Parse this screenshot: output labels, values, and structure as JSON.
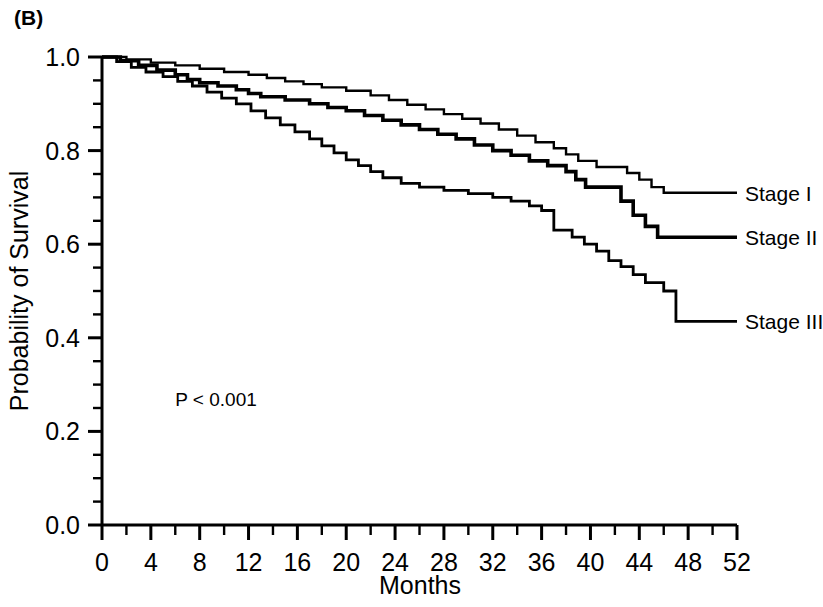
{
  "figure": {
    "panel_label": "(B)",
    "annotation": "P < 0.001"
  },
  "chart_data": {
    "type": "line",
    "title": "",
    "subtitle": "",
    "xlabel": "Months",
    "ylabel": "Probability of Survival",
    "xlim": [
      0,
      52
    ],
    "ylim": [
      0.0,
      1.0
    ],
    "xticks": [
      0,
      4,
      8,
      12,
      16,
      20,
      24,
      28,
      32,
      36,
      40,
      44,
      48,
      52
    ],
    "xtick_labels": [
      "0",
      "4",
      "8",
      "12",
      "16",
      "20",
      "24",
      "28",
      "32",
      "36",
      "40",
      "44",
      "48",
      "52"
    ],
    "x_minor_tick_step": 2,
    "yticks": [
      0.0,
      0.2,
      0.4,
      0.6,
      0.8,
      1.0
    ],
    "ytick_labels": [
      "0.0",
      "0.2",
      "0.4",
      "0.6",
      "0.8",
      "1.0"
    ],
    "y_minor_tick_step": 0.05,
    "grid": false,
    "legend_position": "right",
    "annotations": [
      {
        "text": "P < 0.001",
        "x": 6,
        "y": 0.255
      }
    ],
    "series": [
      {
        "name": "Stage I",
        "legend_label": "Stage I",
        "color": "#000000",
        "line_width": 2.4,
        "final_value": 0.71,
        "steps": [
          [
            0,
            1.0
          ],
          [
            2,
            1.0
          ],
          [
            2,
            0.995
          ],
          [
            4,
            0.995
          ],
          [
            4,
            0.988
          ],
          [
            6,
            0.988
          ],
          [
            6,
            0.982
          ],
          [
            8,
            0.982
          ],
          [
            8,
            0.975
          ],
          [
            10,
            0.975
          ],
          [
            10,
            0.968
          ],
          [
            12,
            0.968
          ],
          [
            12,
            0.962
          ],
          [
            13.5,
            0.962
          ],
          [
            13.5,
            0.955
          ],
          [
            15,
            0.955
          ],
          [
            15,
            0.948
          ],
          [
            16.5,
            0.948
          ],
          [
            16.5,
            0.942
          ],
          [
            18,
            0.942
          ],
          [
            18,
            0.935
          ],
          [
            20,
            0.935
          ],
          [
            20,
            0.928
          ],
          [
            22,
            0.928
          ],
          [
            22,
            0.918
          ],
          [
            23.5,
            0.918
          ],
          [
            23.5,
            0.908
          ],
          [
            25,
            0.908
          ],
          [
            25,
            0.898
          ],
          [
            26.5,
            0.898
          ],
          [
            26.5,
            0.888
          ],
          [
            28,
            0.888
          ],
          [
            28,
            0.878
          ],
          [
            29.5,
            0.878
          ],
          [
            29.5,
            0.868
          ],
          [
            31,
            0.868
          ],
          [
            31,
            0.858
          ],
          [
            32.5,
            0.858
          ],
          [
            32.5,
            0.845
          ],
          [
            34,
            0.845
          ],
          [
            34,
            0.832
          ],
          [
            35.5,
            0.832
          ],
          [
            35.5,
            0.818
          ],
          [
            37,
            0.818
          ],
          [
            37,
            0.805
          ],
          [
            38,
            0.805
          ],
          [
            38,
            0.792
          ],
          [
            39,
            0.792
          ],
          [
            39,
            0.778
          ],
          [
            40.5,
            0.778
          ],
          [
            40.5,
            0.765
          ],
          [
            43,
            0.765
          ],
          [
            43,
            0.752
          ],
          [
            44,
            0.752
          ],
          [
            44,
            0.738
          ],
          [
            45,
            0.738
          ],
          [
            45,
            0.722
          ],
          [
            46,
            0.722
          ],
          [
            46,
            0.71
          ],
          [
            52,
            0.71
          ]
        ]
      },
      {
        "name": "Stage II",
        "legend_label": "Stage II",
        "color": "#000000",
        "line_width": 3.6,
        "final_value": 0.615,
        "steps": [
          [
            0,
            1.0
          ],
          [
            1.5,
            1.0
          ],
          [
            1.5,
            0.992
          ],
          [
            3,
            0.992
          ],
          [
            3,
            0.982
          ],
          [
            4.5,
            0.982
          ],
          [
            4.5,
            0.972
          ],
          [
            6,
            0.972
          ],
          [
            6,
            0.962
          ],
          [
            7,
            0.962
          ],
          [
            7,
            0.952
          ],
          [
            8,
            0.952
          ],
          [
            8,
            0.945
          ],
          [
            9.5,
            0.945
          ],
          [
            9.5,
            0.938
          ],
          [
            11,
            0.938
          ],
          [
            11,
            0.93
          ],
          [
            12,
            0.93
          ],
          [
            12,
            0.922
          ],
          [
            13,
            0.922
          ],
          [
            13,
            0.915
          ],
          [
            15,
            0.915
          ],
          [
            15,
            0.908
          ],
          [
            17,
            0.908
          ],
          [
            17,
            0.9
          ],
          [
            18.5,
            0.9
          ],
          [
            18.5,
            0.892
          ],
          [
            20,
            0.892
          ],
          [
            20,
            0.885
          ],
          [
            21.5,
            0.885
          ],
          [
            21.5,
            0.875
          ],
          [
            23,
            0.875
          ],
          [
            23,
            0.865
          ],
          [
            24.5,
            0.865
          ],
          [
            24.5,
            0.855
          ],
          [
            26,
            0.855
          ],
          [
            26,
            0.845
          ],
          [
            27.5,
            0.845
          ],
          [
            27.5,
            0.835
          ],
          [
            29,
            0.835
          ],
          [
            29,
            0.825
          ],
          [
            30.5,
            0.825
          ],
          [
            30.5,
            0.812
          ],
          [
            32,
            0.812
          ],
          [
            32,
            0.8
          ],
          [
            33.5,
            0.8
          ],
          [
            33.5,
            0.79
          ],
          [
            35,
            0.79
          ],
          [
            35,
            0.778
          ],
          [
            36.5,
            0.778
          ],
          [
            36.5,
            0.768
          ],
          [
            38,
            0.768
          ],
          [
            38,
            0.755
          ],
          [
            38.8,
            0.755
          ],
          [
            38.8,
            0.738
          ],
          [
            39.6,
            0.738
          ],
          [
            39.6,
            0.722
          ],
          [
            42.5,
            0.722
          ],
          [
            42.5,
            0.692
          ],
          [
            43.5,
            0.692
          ],
          [
            43.5,
            0.662
          ],
          [
            44.5,
            0.662
          ],
          [
            44.5,
            0.638
          ],
          [
            45.5,
            0.638
          ],
          [
            45.5,
            0.615
          ],
          [
            52,
            0.615
          ]
        ]
      },
      {
        "name": "Stage III",
        "legend_label": "Stage III",
        "color": "#000000",
        "line_width": 2.8,
        "final_value": 0.435,
        "steps": [
          [
            0,
            1.0
          ],
          [
            1.2,
            1.0
          ],
          [
            1.2,
            0.99
          ],
          [
            2.4,
            0.99
          ],
          [
            2.4,
            0.978
          ],
          [
            3.6,
            0.978
          ],
          [
            3.6,
            0.968
          ],
          [
            5,
            0.968
          ],
          [
            5,
            0.958
          ],
          [
            6.2,
            0.958
          ],
          [
            6.2,
            0.948
          ],
          [
            7.4,
            0.948
          ],
          [
            7.4,
            0.938
          ],
          [
            8.6,
            0.938
          ],
          [
            8.6,
            0.925
          ],
          [
            9.8,
            0.925
          ],
          [
            9.8,
            0.912
          ],
          [
            11,
            0.912
          ],
          [
            11,
            0.9
          ],
          [
            12.2,
            0.9
          ],
          [
            12.2,
            0.885
          ],
          [
            13.4,
            0.885
          ],
          [
            13.4,
            0.87
          ],
          [
            14.6,
            0.87
          ],
          [
            14.6,
            0.855
          ],
          [
            15.8,
            0.855
          ],
          [
            15.8,
            0.84
          ],
          [
            17,
            0.84
          ],
          [
            17,
            0.825
          ],
          [
            18,
            0.825
          ],
          [
            18,
            0.81
          ],
          [
            19,
            0.81
          ],
          [
            19,
            0.795
          ],
          [
            20,
            0.795
          ],
          [
            20,
            0.78
          ],
          [
            21,
            0.78
          ],
          [
            21,
            0.768
          ],
          [
            22,
            0.768
          ],
          [
            22,
            0.755
          ],
          [
            23,
            0.755
          ],
          [
            23,
            0.742
          ],
          [
            24.5,
            0.742
          ],
          [
            24.5,
            0.73
          ],
          [
            26,
            0.73
          ],
          [
            26,
            0.722
          ],
          [
            28,
            0.722
          ],
          [
            28,
            0.715
          ],
          [
            30,
            0.715
          ],
          [
            30,
            0.708
          ],
          [
            32,
            0.708
          ],
          [
            32,
            0.7
          ],
          [
            33.5,
            0.7
          ],
          [
            33.5,
            0.692
          ],
          [
            35,
            0.692
          ],
          [
            35,
            0.682
          ],
          [
            36,
            0.682
          ],
          [
            36,
            0.672
          ],
          [
            37,
            0.672
          ],
          [
            37,
            0.63
          ],
          [
            38.5,
            0.63
          ],
          [
            38.5,
            0.615
          ],
          [
            39.5,
            0.615
          ],
          [
            39.5,
            0.6
          ],
          [
            40.5,
            0.6
          ],
          [
            40.5,
            0.585
          ],
          [
            41.5,
            0.585
          ],
          [
            41.5,
            0.565
          ],
          [
            42.5,
            0.565
          ],
          [
            42.5,
            0.552
          ],
          [
            43.5,
            0.552
          ],
          [
            43.5,
            0.535
          ],
          [
            44.5,
            0.535
          ],
          [
            44.5,
            0.518
          ],
          [
            46,
            0.518
          ],
          [
            46,
            0.5
          ],
          [
            47,
            0.5
          ],
          [
            47,
            0.435
          ],
          [
            52,
            0.435
          ]
        ]
      }
    ]
  },
  "legend": {
    "items": [
      {
        "label": "Stage I"
      },
      {
        "label": "Stage II"
      },
      {
        "label": "Stage III"
      }
    ]
  }
}
